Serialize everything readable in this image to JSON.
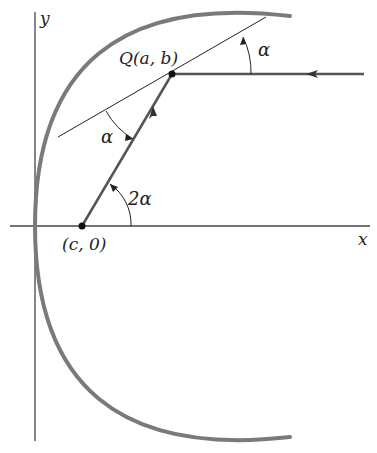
{
  "diagram": {
    "colors": {
      "axis": "#333333",
      "curve": "#777777",
      "ray": "#555555",
      "tangent": "#222222",
      "point": "#111111",
      "text": "#222222"
    },
    "axes": {
      "x_label": "x",
      "y_label": "y"
    },
    "points": {
      "Q": {
        "label_prefix": "Q",
        "label_args": "(a, b)"
      },
      "focus": {
        "label": "(c, 0)"
      }
    },
    "angles": {
      "alpha_top": "α",
      "alpha_tangent": "α",
      "two_alpha": "2α"
    },
    "elements": [
      "parabola (opening right, vertex at origin)",
      "tangent line at Q",
      "incoming horizontal ray from the right toward Q",
      "reflected ray from Q to focus (c, 0)"
    ]
  }
}
